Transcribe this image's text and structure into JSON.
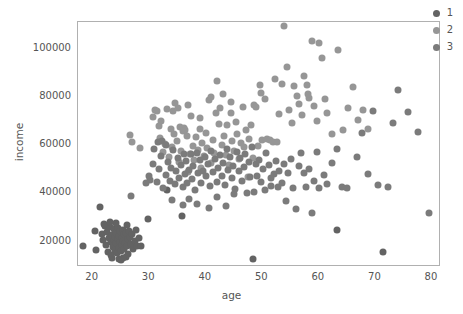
{
  "chart_data": {
    "type": "scatter",
    "title": "",
    "xlabel": "age",
    "ylabel": "income",
    "xlim": [
      17.4,
      81.6
    ],
    "ylim": [
      9100,
      110600
    ],
    "xticks": [
      "20",
      "30",
      "40",
      "50",
      "60",
      "70",
      "80"
    ],
    "xtick_values": [
      20,
      30,
      40,
      50,
      60,
      70,
      80
    ],
    "yticks": [
      "20000",
      "40000",
      "60000",
      "80000",
      "100000"
    ],
    "ytick_values": [
      20000,
      40000,
      60000,
      80000,
      100000
    ],
    "grid": false,
    "legend_position": "upper right",
    "legend_title": "",
    "marker_size_px": 7,
    "series": [
      {
        "name": "1",
        "color": "#636363",
        "points": [
          [
            18.3,
            17800
          ],
          [
            20.4,
            24200
          ],
          [
            20.6,
            16300
          ],
          [
            21.3,
            33800
          ],
          [
            21.6,
            22900
          ],
          [
            21.9,
            20400
          ],
          [
            22.1,
            26100
          ],
          [
            22.3,
            18200
          ],
          [
            22.5,
            23400
          ],
          [
            22.7,
            15200
          ],
          [
            22.9,
            21000
          ],
          [
            23.0,
            25600
          ],
          [
            23.2,
            19300
          ],
          [
            23.3,
            13900
          ],
          [
            23.5,
            22300
          ],
          [
            23.6,
            17400
          ],
          [
            23.7,
            20100
          ],
          [
            23.8,
            24800
          ],
          [
            23.9,
            16000
          ],
          [
            24.0,
            21700
          ],
          [
            24.1,
            18900
          ],
          [
            24.2,
            23100
          ],
          [
            24.3,
            14700
          ],
          [
            24.4,
            20600
          ],
          [
            24.5,
            25300
          ],
          [
            24.6,
            17100
          ],
          [
            24.7,
            22000
          ],
          [
            24.8,
            19500
          ],
          [
            24.9,
            23900
          ],
          [
            25.0,
            15800
          ],
          [
            25.1,
            21200
          ],
          [
            25.2,
            18400
          ],
          [
            25.3,
            24400
          ],
          [
            25.4,
            20000
          ],
          [
            25.5,
            16700
          ],
          [
            25.6,
            22600
          ],
          [
            25.7,
            19100
          ],
          [
            25.8,
            13400
          ],
          [
            25.9,
            23300
          ],
          [
            26.1,
            17900
          ],
          [
            26.2,
            20800
          ],
          [
            26.3,
            14300
          ],
          [
            26.5,
            24100
          ],
          [
            26.6,
            21500
          ],
          [
            26.8,
            18600
          ],
          [
            27.0,
            22800
          ],
          [
            27.2,
            16400
          ],
          [
            27.4,
            19800
          ],
          [
            27.6,
            24600
          ],
          [
            27.9,
            17600
          ],
          [
            28.2,
            21300
          ],
          [
            28.6,
            18000
          ],
          [
            23.4,
            12900
          ],
          [
            24.6,
            12600
          ],
          [
            25.4,
            13000
          ],
          [
            26.0,
            26500
          ],
          [
            22.0,
            27100
          ],
          [
            25.0,
            12200
          ],
          [
            24.2,
            27400
          ],
          [
            23.1,
            27800
          ],
          [
            29.7,
            29100
          ],
          [
            48.4,
            12400
          ],
          [
            63.2,
            24600
          ],
          [
            71.3,
            15300
          ],
          [
            35.8,
            30100
          ],
          [
            33.1,
            40800
          ]
        ]
      },
      {
        "name": "2",
        "color": "#969696",
        "points": [
          [
            26.6,
            63800
          ],
          [
            27.0,
            60900
          ],
          [
            28.3,
            58200
          ],
          [
            30.6,
            71300
          ],
          [
            31.1,
            74200
          ],
          [
            31.4,
            73600
          ],
          [
            31.9,
            62400
          ],
          [
            32.0,
            69700
          ],
          [
            32.4,
            56800
          ],
          [
            32.8,
            60100
          ],
          [
            33.2,
            74500
          ],
          [
            33.5,
            54600
          ],
          [
            33.8,
            66200
          ],
          [
            34.1,
            58900
          ],
          [
            34.4,
            64000
          ],
          [
            34.6,
            77000
          ],
          [
            34.9,
            61500
          ],
          [
            35.2,
            52800
          ],
          [
            35.4,
            67100
          ],
          [
            35.7,
            57300
          ],
          [
            36.0,
            65400
          ],
          [
            36.2,
            66800
          ],
          [
            36.4,
            65900
          ],
          [
            36.6,
            63200
          ],
          [
            36.9,
            48600
          ],
          [
            37.2,
            56000
          ],
          [
            37.4,
            71700
          ],
          [
            37.7,
            59400
          ],
          [
            38.0,
            53600
          ],
          [
            38.3,
            62900
          ],
          [
            38.6,
            57700
          ],
          [
            38.9,
            66400
          ],
          [
            39.1,
            50300
          ],
          [
            39.4,
            60600
          ],
          [
            39.7,
            55100
          ],
          [
            40.0,
            64800
          ],
          [
            40.3,
            58400
          ],
          [
            40.6,
            78300
          ],
          [
            40.9,
            52100
          ],
          [
            41.2,
            61900
          ],
          [
            41.5,
            56500
          ],
          [
            41.8,
            72800
          ],
          [
            42.0,
            86200
          ],
          [
            42.3,
            68500
          ],
          [
            42.6,
            74800
          ],
          [
            42.9,
            59800
          ],
          [
            43.2,
            63500
          ],
          [
            43.5,
            55700
          ],
          [
            43.8,
            67800
          ],
          [
            44.1,
            51400
          ],
          [
            44.4,
            73100
          ],
          [
            44.7,
            61200
          ],
          [
            45.0,
            57000
          ],
          [
            45.3,
            69200
          ],
          [
            45.6,
            64300
          ],
          [
            45.9,
            53900
          ],
          [
            46.2,
            60400
          ],
          [
            46.5,
            75300
          ],
          [
            46.8,
            58700
          ],
          [
            47.1,
            66000
          ],
          [
            47.4,
            46200
          ],
          [
            47.7,
            62100
          ],
          [
            48.0,
            68000
          ],
          [
            48.3,
            54300
          ],
          [
            48.6,
            76200
          ],
          [
            48.9,
            75500
          ],
          [
            49.2,
            59100
          ],
          [
            49.5,
            84700
          ],
          [
            50.0,
            61800
          ],
          [
            50.4,
            78900
          ],
          [
            50.9,
            62300
          ],
          [
            51.3,
            61600
          ],
          [
            51.8,
            60800
          ],
          [
            52.2,
            87000
          ],
          [
            52.6,
            61000
          ],
          [
            53.0,
            72400
          ],
          [
            53.5,
            85100
          ],
          [
            53.9,
            108900
          ],
          [
            54.3,
            92100
          ],
          [
            54.7,
            74300
          ],
          [
            55.2,
            68800
          ],
          [
            55.6,
            83900
          ],
          [
            56.1,
            80100
          ],
          [
            56.5,
            76700
          ],
          [
            57.0,
            72000
          ],
          [
            57.4,
            88300
          ],
          [
            57.9,
            84300
          ],
          [
            58.3,
            79000
          ],
          [
            58.8,
            102700
          ],
          [
            59.2,
            75800
          ],
          [
            59.7,
            69400
          ],
          [
            60.1,
            102100
          ],
          [
            60.6,
            95600
          ],
          [
            61.0,
            78600
          ],
          [
            61.5,
            72700
          ],
          [
            62.4,
            64100
          ],
          [
            63.3,
            99200
          ],
          [
            64.2,
            66000
          ],
          [
            65.1,
            75000
          ],
          [
            66.0,
            83600
          ],
          [
            66.9,
            70000
          ],
          [
            67.8,
            74200
          ],
          [
            68.7,
            66400
          ],
          [
            31.8,
            67400
          ],
          [
            34.2,
            73900
          ],
          [
            35.0,
            75100
          ],
          [
            36.8,
            76400
          ],
          [
            39.0,
            70900
          ],
          [
            41.0,
            79500
          ],
          [
            43.0,
            80600
          ],
          [
            44.5,
            77600
          ],
          [
            49.8,
            81200
          ],
          [
            58.0,
            80600
          ]
        ]
      },
      {
        "name": "3",
        "color": "#7b7b7b",
        "points": [
          [
            26.7,
            38700
          ],
          [
            30.2,
            45200
          ],
          [
            30.7,
            51800
          ],
          [
            31.3,
            44300
          ],
          [
            31.8,
            49600
          ],
          [
            32.1,
            55200
          ],
          [
            32.5,
            41900
          ],
          [
            32.9,
            47300
          ],
          [
            33.3,
            52700
          ],
          [
            33.6,
            44800
          ],
          [
            33.9,
            50100
          ],
          [
            34.2,
            57400
          ],
          [
            34.5,
            43600
          ],
          [
            34.8,
            48900
          ],
          [
            35.1,
            54200
          ],
          [
            35.3,
            46100
          ],
          [
            35.6,
            51400
          ],
          [
            35.9,
            42300
          ],
          [
            36.1,
            56100
          ],
          [
            36.3,
            47700
          ],
          [
            36.5,
            53000
          ],
          [
            36.7,
            44100
          ],
          [
            37.0,
            49400
          ],
          [
            37.3,
            55800
          ],
          [
            37.5,
            45500
          ],
          [
            37.8,
            50800
          ],
          [
            38.1,
            41200
          ],
          [
            38.4,
            56500
          ],
          [
            38.7,
            48200
          ],
          [
            39.0,
            53500
          ],
          [
            39.2,
            43900
          ],
          [
            39.5,
            49000
          ],
          [
            39.8,
            54800
          ],
          [
            40.1,
            46600
          ],
          [
            40.4,
            51900
          ],
          [
            40.7,
            42800
          ],
          [
            41.0,
            57100
          ],
          [
            41.3,
            48500
          ],
          [
            41.6,
            53800
          ],
          [
            41.9,
            44500
          ],
          [
            42.2,
            50000
          ],
          [
            42.5,
            55500
          ],
          [
            42.8,
            46900
          ],
          [
            43.1,
            52200
          ],
          [
            43.4,
            43200
          ],
          [
            43.7,
            57800
          ],
          [
            44.0,
            49200
          ],
          [
            44.3,
            54500
          ],
          [
            44.6,
            45800
          ],
          [
            44.9,
            51100
          ],
          [
            45.2,
            41600
          ],
          [
            45.5,
            56800
          ],
          [
            45.8,
            48800
          ],
          [
            46.1,
            54100
          ],
          [
            46.4,
            44900
          ],
          [
            46.7,
            50400
          ],
          [
            47.0,
            55900
          ],
          [
            47.3,
            39800
          ],
          [
            47.6,
            52600
          ],
          [
            47.9,
            46300
          ],
          [
            48.2,
            58900
          ],
          [
            48.5,
            40300
          ],
          [
            48.8,
            51600
          ],
          [
            49.1,
            47000
          ],
          [
            49.4,
            53300
          ],
          [
            49.7,
            44200
          ],
          [
            50.2,
            49800
          ],
          [
            50.7,
            56300
          ],
          [
            51.1,
            51200
          ],
          [
            51.6,
            42500
          ],
          [
            52.0,
            47500
          ],
          [
            52.5,
            53100
          ],
          [
            52.9,
            49000
          ],
          [
            53.4,
            43800
          ],
          [
            53.8,
            51700
          ],
          [
            54.2,
            36400
          ],
          [
            54.6,
            48000
          ],
          [
            55.1,
            53700
          ],
          [
            55.5,
            42000
          ],
          [
            56.0,
            33200
          ],
          [
            56.4,
            50900
          ],
          [
            56.9,
            56200
          ],
          [
            57.3,
            47900
          ],
          [
            57.8,
            42200
          ],
          [
            58.2,
            49500
          ],
          [
            58.7,
            31600
          ],
          [
            59.1,
            44600
          ],
          [
            59.6,
            56900
          ],
          [
            60.0,
            41800
          ],
          [
            60.9,
            47200
          ],
          [
            61.4,
            43400
          ],
          [
            62.3,
            52000
          ],
          [
            63.2,
            57900
          ],
          [
            64.1,
            42100
          ],
          [
            65.0,
            41900
          ],
          [
            66.8,
            54500
          ],
          [
            67.7,
            64600
          ],
          [
            68.6,
            47500
          ],
          [
            69.5,
            73800
          ],
          [
            70.4,
            42900
          ],
          [
            72.2,
            42200
          ],
          [
            73.1,
            68600
          ],
          [
            74.0,
            82500
          ],
          [
            75.8,
            73500
          ],
          [
            77.6,
            64900
          ],
          [
            79.4,
            31600
          ],
          [
            34.0,
            36900
          ],
          [
            36.0,
            34700
          ],
          [
            37.0,
            37400
          ],
          [
            38.5,
            35200
          ],
          [
            40.5,
            33600
          ],
          [
            42.0,
            38100
          ],
          [
            43.6,
            34300
          ],
          [
            45.0,
            39200
          ],
          [
            30.8,
            58000
          ],
          [
            29.5,
            44000
          ],
          [
            30.0,
            46900
          ],
          [
            31.5,
            60800
          ],
          [
            32.2,
            61500
          ],
          [
            33.0,
            59500
          ],
          [
            50.5,
            41000
          ],
          [
            51.5,
            45900
          ],
          [
            52.8,
            42300
          ]
        ]
      }
    ]
  },
  "legend": {
    "items": [
      {
        "label": "1",
        "color": "#636363"
      },
      {
        "label": "2",
        "color": "#969696"
      },
      {
        "label": "3",
        "color": "#7b7b7b"
      }
    ]
  }
}
